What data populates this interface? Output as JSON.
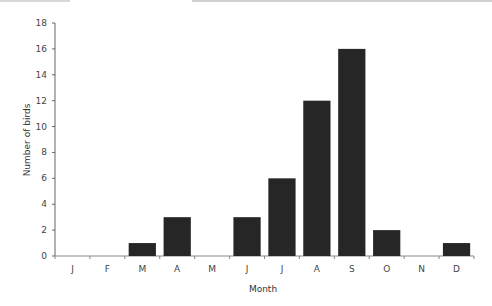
{
  "chart_data": {
    "type": "bar",
    "title": "",
    "xlabel": "Month",
    "ylabel": "Number of birds",
    "categories": [
      "J",
      "F",
      "M",
      "A",
      "M",
      "J",
      "J",
      "A",
      "S",
      "O",
      "N",
      "D"
    ],
    "values": [
      0,
      0,
      1,
      3,
      0,
      3,
      6,
      12,
      16,
      2,
      0,
      1
    ],
    "ylim": [
      0,
      18
    ],
    "yticks": [
      0,
      2,
      4,
      6,
      8,
      10,
      12,
      14,
      16,
      18
    ],
    "grid": false,
    "legend": null,
    "bar_color": "#262626"
  }
}
